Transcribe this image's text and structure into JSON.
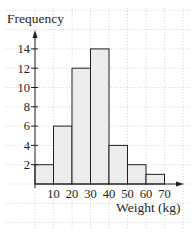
{
  "chart_data": {
    "type": "bar",
    "subtype": "histogram",
    "title": "",
    "xlabel": "Weight (kg)",
    "ylabel": "Frequency",
    "bins": [
      {
        "from": 0,
        "to": 10,
        "value": 2
      },
      {
        "from": 10,
        "to": 20,
        "value": 6
      },
      {
        "from": 20,
        "to": 30,
        "value": 12
      },
      {
        "from": 30,
        "to": 40,
        "value": 14
      },
      {
        "from": 40,
        "to": 50,
        "value": 4
      },
      {
        "from": 50,
        "to": 60,
        "value": 2
      },
      {
        "from": 60,
        "to": 70,
        "value": 1
      }
    ],
    "categories": [
      "0-10",
      "10-20",
      "20-30",
      "30-40",
      "40-50",
      "50-60",
      "60-70"
    ],
    "values": [
      2,
      6,
      12,
      14,
      4,
      2,
      1
    ],
    "x_ticks": [
      10,
      20,
      30,
      40,
      50,
      60,
      70
    ],
    "y_ticks": [
      2,
      4,
      6,
      8,
      10,
      12,
      14
    ],
    "xlim": [
      0,
      70
    ],
    "ylim": [
      0,
      14
    ],
    "grid": true,
    "grid_style": "dotted",
    "legend": null,
    "colors": {
      "bar_fill": "#ececec",
      "bar_stroke": "#231f20",
      "axis": "#231f20",
      "grid": "#c8c8c8"
    }
  }
}
